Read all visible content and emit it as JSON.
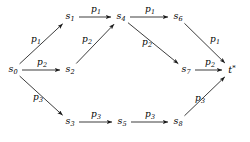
{
  "figure": {
    "kind": "directed-graph",
    "background": "#ffffff",
    "stroke_color": "#1a1a1a",
    "width": 250,
    "height": 142
  },
  "nodes": [
    {
      "id": "s0",
      "base": "s",
      "sub": "0",
      "sup": "",
      "x": 13,
      "y": 70
    },
    {
      "id": "s1",
      "base": "s",
      "sub": "1",
      "sup": "",
      "x": 70,
      "y": 17
    },
    {
      "id": "s2",
      "base": "s",
      "sub": "2",
      "sup": "",
      "x": 70,
      "y": 70
    },
    {
      "id": "s3",
      "base": "s",
      "sub": "3",
      "sup": "",
      "x": 70,
      "y": 122
    },
    {
      "id": "s4",
      "base": "s",
      "sub": "4",
      "sup": "",
      "x": 121,
      "y": 17
    },
    {
      "id": "s5",
      "base": "s",
      "sub": "5",
      "sup": "",
      "x": 122,
      "y": 122
    },
    {
      "id": "s6",
      "base": "s",
      "sub": "6",
      "sup": "",
      "x": 178,
      "y": 17
    },
    {
      "id": "s7",
      "base": "s",
      "sub": "7",
      "sup": "",
      "x": 186,
      "y": 70
    },
    {
      "id": "s8",
      "base": "s",
      "sub": "8",
      "sup": "",
      "x": 178,
      "y": 122
    },
    {
      "id": "t",
      "base": "t",
      "sub": "",
      "sup": "*",
      "x": 232,
      "y": 70
    }
  ],
  "edges": [
    {
      "id": "e-s0-s1",
      "from": "s0",
      "to": "s1",
      "base": "p",
      "sub": "1",
      "lx": 36,
      "ly": 40
    },
    {
      "id": "e-s0-s2",
      "from": "s0",
      "to": "s2",
      "base": "p",
      "sub": "2",
      "lx": 42,
      "ly": 63
    },
    {
      "id": "e-s0-s3",
      "from": "s0",
      "to": "s3",
      "base": "p",
      "sub": "3",
      "lx": 38,
      "ly": 98
    },
    {
      "id": "e-s1-s4",
      "from": "s1",
      "to": "s4",
      "base": "p",
      "sub": "1",
      "lx": 96,
      "ly": 10
    },
    {
      "id": "e-s2-s4",
      "from": "s2",
      "to": "s4",
      "base": "p",
      "sub": "2",
      "lx": 87,
      "ly": 40
    },
    {
      "id": "e-s3-s5",
      "from": "s3",
      "to": "s5",
      "base": "p",
      "sub": "3",
      "lx": 96,
      "ly": 115
    },
    {
      "id": "e-s4-s6",
      "from": "s4",
      "to": "s6",
      "base": "p",
      "sub": "1",
      "lx": 150,
      "ly": 10
    },
    {
      "id": "e-s4-s7",
      "from": "s4",
      "to": "s7",
      "base": "p",
      "sub": "2",
      "lx": 147,
      "ly": 43
    },
    {
      "id": "e-s5-s8",
      "from": "s5",
      "to": "s8",
      "base": "p",
      "sub": "3",
      "lx": 150,
      "ly": 115
    },
    {
      "id": "e-s6-t",
      "from": "s6",
      "to": "t",
      "base": "p",
      "sub": "1",
      "lx": 215,
      "ly": 40
    },
    {
      "id": "e-s7-t",
      "from": "s7",
      "to": "t",
      "base": "p",
      "sub": "2",
      "lx": 210,
      "ly": 63
    },
    {
      "id": "e-s8-t",
      "from": "s8",
      "to": "t",
      "base": "p",
      "sub": "3",
      "lx": 200,
      "ly": 99
    }
  ]
}
